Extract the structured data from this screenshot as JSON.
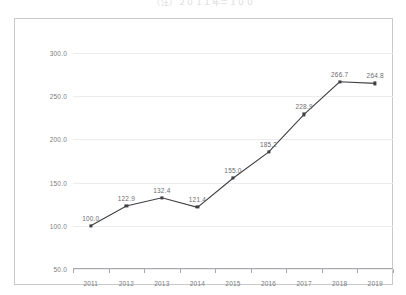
{
  "chart_data": {
    "type": "line",
    "title": "（注）２０１１年＝１００",
    "xlabel": "",
    "ylabel": "",
    "categories": [
      "2011",
      "2012",
      "2013",
      "2014",
      "2015",
      "2016",
      "2017",
      "2018",
      "2019"
    ],
    "values": [
      100.0,
      122.9,
      132.4,
      121.4,
      155.0,
      185.2,
      228.9,
      266.7,
      264.8
    ],
    "point_labels": [
      "100.0",
      "122.9",
      "132.4",
      "121.4",
      "155.0",
      "185.2",
      "228.9",
      "266.7",
      "264.8"
    ],
    "series": [
      {
        "name": "index",
        "values": [
          100.0,
          122.9,
          132.4,
          121.4,
          155.0,
          185.2,
          228.9,
          266.7,
          264.8
        ]
      }
    ],
    "ylim": [
      50.0,
      300.0
    ],
    "ytick_values": [
      300.0,
      250.0,
      200.0,
      150.0,
      100.0,
      50.0
    ],
    "ytick_labels": [
      "300.0",
      "250.0",
      "200.0",
      "150.0",
      "100.0",
      "50.0"
    ],
    "ystep": 50.0,
    "grid": true,
    "grid_axis": "y",
    "legend": false,
    "legend_position": "none",
    "marker": "square",
    "colors": {
      "line": "#3f3f44",
      "marker": "#3f3f44",
      "grid": "#ececee",
      "axis": "#a8a8ad",
      "frame": "#c9c9cc",
      "text": "#7d7d82",
      "background": "#ffffff"
    }
  }
}
